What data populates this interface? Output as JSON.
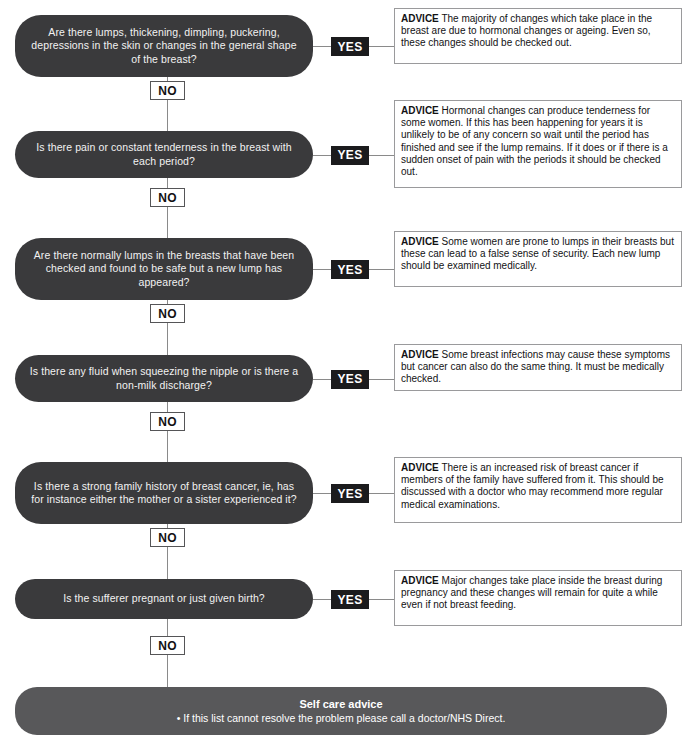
{
  "chart": {
    "yes_label": "YES",
    "no_label": "NO",
    "advice_label": "ADVICE",
    "colors": {
      "question_fill": "#3a3a3c",
      "yes_fill": "#1b1b1d",
      "banner_fill": "#58585a",
      "line": "#8a8a8a",
      "advice_border": "#9a9a9c",
      "text_light": "#f2f2f2",
      "text_dark": "#121214"
    }
  },
  "steps": [
    {
      "question": "Are there lumps, thickening, dimpling, puckering, depressions in the skin or changes in the general shape of the breast?",
      "yes": "YES",
      "no": "NO",
      "advice_label": "ADVICE",
      "advice": "The majority of changes which take place in the breast are due to hormonal changes or ageing. Even so, these changes should be checked out."
    },
    {
      "question": "Is there pain or constant tenderness in the breast with each period?",
      "yes": "YES",
      "no": "NO",
      "advice_label": "ADVICE",
      "advice": "Hormonal changes can produce tenderness for some women. If this has been happening for years it is unlikely to be of any concern so wait until the period has finished and see if the lump remains. If it does or if there is a sudden onset of pain with the periods it should be checked out."
    },
    {
      "question": "Are there normally lumps in the breasts that have been checked and found to be safe but a new lump has appeared?",
      "yes": "YES",
      "no": "NO",
      "advice_label": "ADVICE",
      "advice": "Some women are prone to lumps in their breasts but these can lead to a false sense of security. Each new lump should be examined medically."
    },
    {
      "question": "Is there any fluid when squeezing the nipple or is there a non-milk discharge?",
      "yes": "YES",
      "no": "NO",
      "advice_label": "ADVICE",
      "advice": "Some breast infections may cause these symptoms but cancer can also do the same thing. It must be medically checked."
    },
    {
      "question": "Is there a strong family history of breast cancer, ie, has for instance either the mother or a sister experienced it?",
      "yes": "YES",
      "no": "NO",
      "advice_label": "ADVICE",
      "advice": "There is an increased risk of breast cancer if members of the family have suffered from it. This should be discussed with a doctor who may recommend more regular medical examinations."
    },
    {
      "question": "Is the sufferer pregnant or just given birth?",
      "yes": "YES",
      "no": "NO",
      "advice_label": "ADVICE",
      "advice": "Major changes take place inside the breast during pregnancy and these changes will remain for quite a while even if not breast feeding."
    }
  ],
  "self_care": {
    "title": "Self care advice",
    "bullet": "• If this list cannot resolve the problem please call a doctor/NHS Direct."
  }
}
